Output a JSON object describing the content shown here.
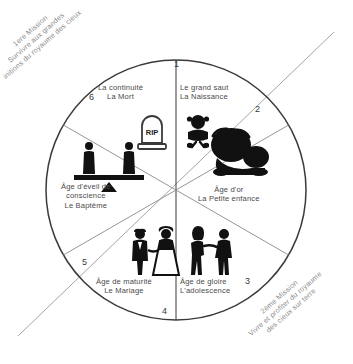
{
  "diagram": {
    "type": "six-sector-wheel",
    "center": {
      "x": 176,
      "y": 190
    },
    "radius": 130
  },
  "missions": [
    {
      "id": "mission-1",
      "lines": [
        "1ere Mission",
        "Survivre aux grandes",
        "initions du royaume des cieux"
      ]
    },
    {
      "id": "mission-2",
      "lines": [
        "2ème Mission",
        "Vivre et profiter du royaume",
        "des cieux sur terre"
      ]
    }
  ],
  "sectors": [
    {
      "number": "1",
      "title": "Le grand saut",
      "subtitle": "La Naissance",
      "icon": "baby-icon"
    },
    {
      "number": "2",
      "title": "Âge d'or",
      "subtitle": "La Petite enfance",
      "icon": "toddler-icon"
    },
    {
      "number": "3",
      "title": "Âge de gloire",
      "subtitle": "L'adolescence",
      "icon": "teenagers-icon"
    },
    {
      "number": "4",
      "title": "Âge de maturité",
      "subtitle": "Le Mariage",
      "icon": "wedding-couple-icon"
    },
    {
      "number": "5",
      "title": "Âge d'éveil de",
      "subtitle": "conscience",
      "subtitle2": "Le Baptême",
      "icon": "balance-scale-icon"
    },
    {
      "number": "6",
      "title": "La continuité",
      "subtitle": "La Mort",
      "icon": "gravestone-icon"
    }
  ],
  "labels": {
    "gravestone_text": "RIP"
  },
  "colors": {
    "stroke": "#3a3a3a",
    "text": "#4a4a4a",
    "muted": "#8a8a8a",
    "icon": "#111111",
    "background": "#ffffff"
  }
}
